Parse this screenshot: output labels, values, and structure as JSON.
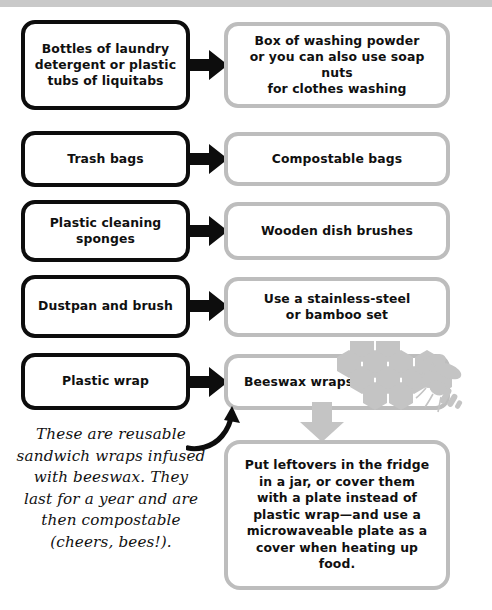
{
  "document": {
    "type": "plastic-free-swaps-infographic",
    "title_band_color": "#c9c9c9",
    "left_box_border_color": "#0d0d0d",
    "right_box_border_color": "#bdbdbd",
    "arrow_color": "#0d0d0d",
    "decoration_color": "#c4c4c4"
  },
  "rows": [
    {
      "id": "laundry",
      "from": "Bottles of laundry\ndetergent or plastic\ntubs of liquitabs",
      "arrow": "arrow-right-icon",
      "to": "Box of washing powder\nor you can also use soap nuts\nfor clothes washing"
    },
    {
      "id": "trash-bags",
      "from": "Trash bags",
      "arrow": "arrow-right-icon",
      "to": "Compostable bags"
    },
    {
      "id": "sponges",
      "from": "Plastic cleaning\nsponges",
      "arrow": "arrow-right-icon",
      "to": "Wooden dish brushes"
    },
    {
      "id": "dustpan",
      "from": "Dustpan and brush",
      "arrow": "arrow-right-icon",
      "to": "Use a stainless-steel\nor bamboo set"
    },
    {
      "id": "plastic-wrap",
      "from": "Plastic wrap",
      "arrow": "arrow-right-icon",
      "to": "Beeswax wraps"
    }
  ],
  "annotation": {
    "text": "These are reusable\nsandwich wraps infused\nwith beeswax. They\nlast for a year and are\nthen compostable\n(cheers, bees!).",
    "arrow": "curved-arrow-up-icon"
  },
  "followup": {
    "arrow": "arrow-down-icon",
    "text": "Put leftovers in the fridge\nin a jar, or cover them\nwith a plate instead of\nplastic wrap—and use a\nmicrowaveable plate as a\ncover when heating up food."
  },
  "decorations": {
    "honeycomb": "honeycomb-icon",
    "bee": "bee-icon"
  }
}
